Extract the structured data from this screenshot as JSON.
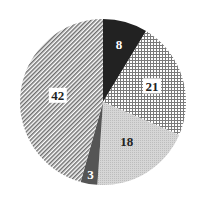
{
  "chart_data": {
    "type": "pie",
    "title": "",
    "start_angle_deg": 0,
    "direction": "clockwise",
    "categories": [
      "A",
      "B",
      "C",
      "D",
      "E"
    ],
    "values": [
      8,
      21,
      18,
      3,
      42
    ],
    "labels": [
      "8",
      "21",
      "18",
      "3",
      "42"
    ],
    "fills": [
      {
        "pattern": "solid",
        "color": "#222222"
      },
      {
        "pattern": "grid",
        "color": "#7a7a7a",
        "background": "#ffffff"
      },
      {
        "pattern": "stipple",
        "color": "#cfcfcf"
      },
      {
        "pattern": "solid",
        "color": "#555555"
      },
      {
        "pattern": "diagonal-hatch",
        "color": "#6e6e6e",
        "background": "#ffffff"
      }
    ],
    "label_colors": [
      "#ffffff",
      "#222222",
      "#222222",
      "#ffffff",
      "#222222"
    ],
    "label_backgrounds": [
      "none",
      "#ffffff",
      "none",
      "none",
      "#ffffff"
    ],
    "legend": "none",
    "grid": false
  }
}
